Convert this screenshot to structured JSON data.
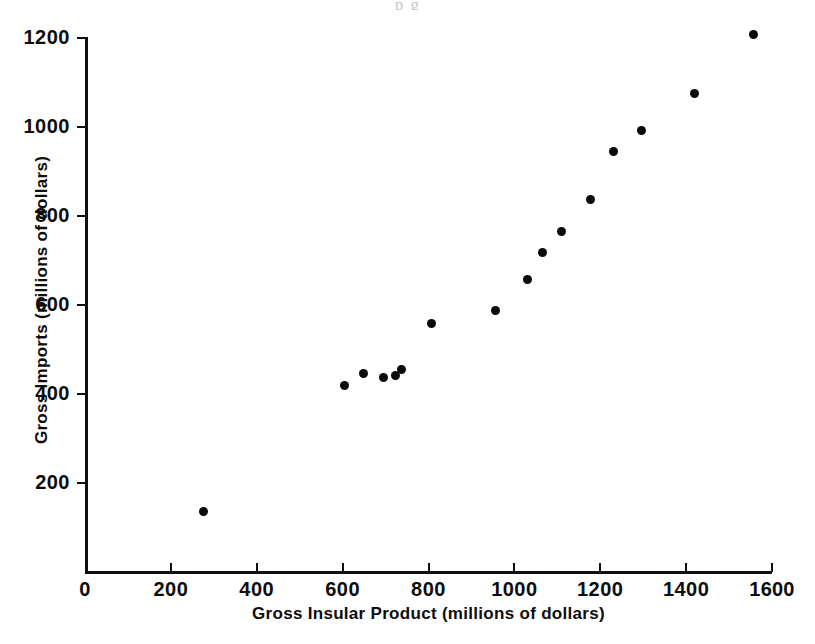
{
  "figure": {
    "top_bleed_text": "p   g",
    "background_color": "#ffffff",
    "marker_color": "#0a0a0a",
    "axis_color": "#101010"
  },
  "axes": {
    "x_title": "Gross  Insular  Product (millions of dollars)",
    "y_title": "Gross Imports (millions of dollars)",
    "x_ticks": [
      "0",
      "200",
      "400",
      "600",
      "800",
      "1000",
      "1200",
      "1400",
      "1600"
    ],
    "y_ticks": [
      "200",
      "400",
      "600",
      "800",
      "1000",
      "1200"
    ]
  },
  "chart_data": {
    "type": "scatter",
    "title": "",
    "xlabel": "Gross Insular Product (millions of dollars)",
    "ylabel": "Gross Imports (millions of dollars)",
    "xlim": [
      0,
      1600
    ],
    "ylim": [
      0,
      1250
    ],
    "xticks": [
      0,
      200,
      400,
      600,
      800,
      1000,
      1200,
      1400,
      1600
    ],
    "yticks": [
      200,
      400,
      600,
      800,
      1000,
      1200
    ],
    "grid": false,
    "legend": null,
    "marker": "filled-circle",
    "series": [
      {
        "name": "Gross Imports vs Gross Insular Product",
        "points": [
          {
            "x": 276,
            "y": 137
          },
          {
            "x": 605,
            "y": 420
          },
          {
            "x": 649,
            "y": 447
          },
          {
            "x": 696,
            "y": 438
          },
          {
            "x": 722,
            "y": 441
          },
          {
            "x": 736,
            "y": 454
          },
          {
            "x": 806,
            "y": 559
          },
          {
            "x": 955,
            "y": 587
          },
          {
            "x": 1030,
            "y": 658
          },
          {
            "x": 1065,
            "y": 717
          },
          {
            "x": 1109,
            "y": 766
          },
          {
            "x": 1177,
            "y": 838
          },
          {
            "x": 1231,
            "y": 946
          },
          {
            "x": 1296,
            "y": 993
          },
          {
            "x": 1420,
            "y": 1076
          },
          {
            "x": 1556,
            "y": 1207
          }
        ]
      }
    ]
  }
}
